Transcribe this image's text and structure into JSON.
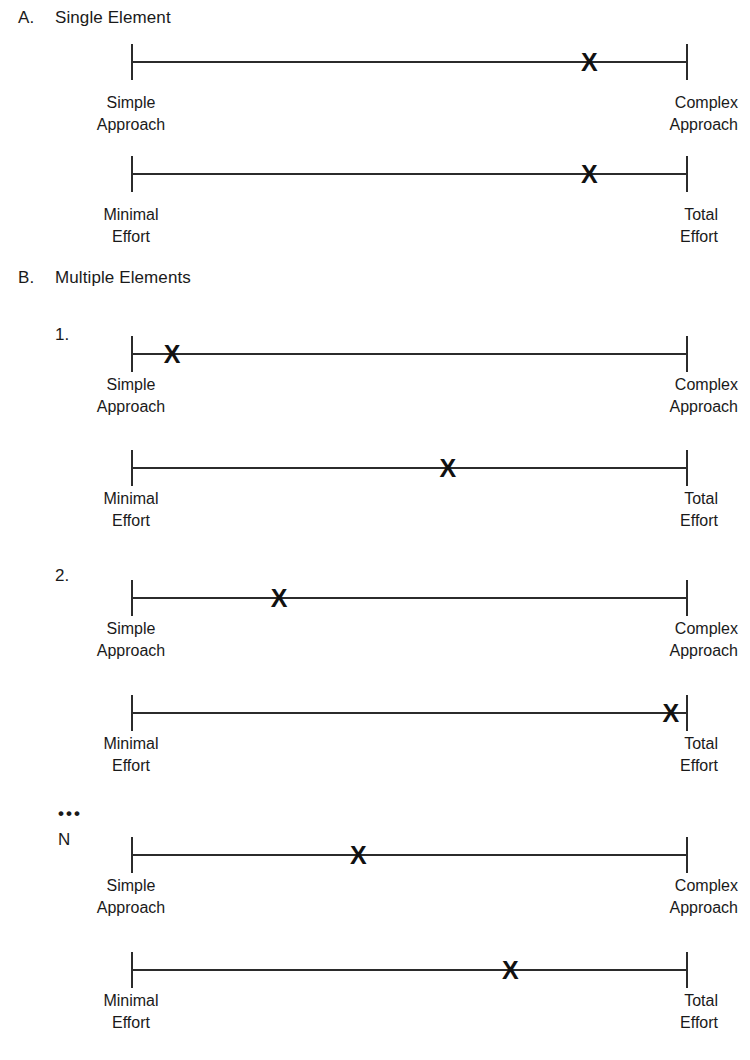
{
  "figure": {
    "width": 750,
    "height": 1060,
    "background": "#ffffff",
    "line_color": "#2b2b2b",
    "marker_glyph": "X",
    "ellipsis": "•••"
  },
  "sections": [
    {
      "letter": "A.",
      "title": "Single Element",
      "items": [
        {
          "number": "",
          "scales": [
            {
              "left_label_line1": "Simple",
              "left_label_line2": "Approach",
              "right_label_line1": "Complex",
              "right_label_line2": "Approach",
              "marker_percent": 82.3
            },
            {
              "left_label_line1": "Minimal",
              "left_label_line2": "Effort",
              "right_label_line1": "Total",
              "right_label_line2": "Effort",
              "marker_percent": 82.3
            }
          ]
        }
      ]
    },
    {
      "letter": "B.",
      "title": "Multiple Elements",
      "items": [
        {
          "number": "1.",
          "scales": [
            {
              "left_label_line1": "Simple",
              "left_label_line2": "Approach",
              "right_label_line1": "Complex",
              "right_label_line2": "Approach",
              "marker_percent": 7.4
            },
            {
              "left_label_line1": "Minimal",
              "left_label_line2": "Effort",
              "right_label_line1": "Total",
              "right_label_line2": "Effort",
              "marker_percent": 56.9
            }
          ]
        },
        {
          "number": "2.",
          "scales": [
            {
              "left_label_line1": "Simple",
              "left_label_line2": "Approach",
              "right_label_line1": "Complex",
              "right_label_line2": "Approach",
              "marker_percent": 26.6
            },
            {
              "left_label_line1": "Minimal",
              "left_label_line2": "Effort",
              "right_label_line1": "Total",
              "right_label_line2": "Effort",
              "marker_percent": 96.9
            }
          ]
        },
        {
          "number": "N",
          "scales": [
            {
              "left_label_line1": "Simple",
              "left_label_line2": "Approach",
              "right_label_line1": "Complex",
              "right_label_line2": "Approach",
              "marker_percent": 40.8
            },
            {
              "left_label_line1": "Minimal",
              "left_label_line2": "Effort",
              "right_label_line1": "Total",
              "right_label_line2": "Effort",
              "marker_percent": 68.1
            }
          ]
        }
      ]
    }
  ],
  "chart_data": {
    "type": "scatter",
    "title": "",
    "scales": [
      {
        "panel": "A",
        "item": "Single Element",
        "scale": "Approach",
        "left_anchor": "Simple Approach",
        "right_anchor": "Complex Approach",
        "value_percent": 82.3
      },
      {
        "panel": "A",
        "item": "Single Element",
        "scale": "Effort",
        "left_anchor": "Minimal Effort",
        "right_anchor": "Total Effort",
        "value_percent": 82.3
      },
      {
        "panel": "B",
        "item": "1.",
        "scale": "Approach",
        "left_anchor": "Simple Approach",
        "right_anchor": "Complex Approach",
        "value_percent": 7.4
      },
      {
        "panel": "B",
        "item": "1.",
        "scale": "Effort",
        "left_anchor": "Minimal Effort",
        "right_anchor": "Total Effort",
        "value_percent": 56.9
      },
      {
        "panel": "B",
        "item": "2.",
        "scale": "Approach",
        "left_anchor": "Simple Approach",
        "right_anchor": "Complex Approach",
        "value_percent": 26.6
      },
      {
        "panel": "B",
        "item": "2.",
        "scale": "Effort",
        "left_anchor": "Minimal Effort",
        "right_anchor": "Total Effort",
        "value_percent": 96.9
      },
      {
        "panel": "B",
        "item": "N",
        "scale": "Approach",
        "left_anchor": "Simple Approach",
        "right_anchor": "Complex Approach",
        "value_percent": 40.8
      },
      {
        "panel": "B",
        "item": "N",
        "scale": "Effort",
        "left_anchor": "Minimal Effort",
        "right_anchor": "Total Effort",
        "value_percent": 68.1
      }
    ],
    "xlabel": "",
    "ylabel": "",
    "xlim": [
      0,
      100
    ],
    "grid": false,
    "legend": "none"
  }
}
